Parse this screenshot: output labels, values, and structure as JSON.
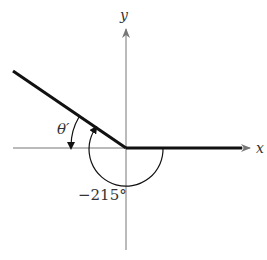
{
  "diagram": {
    "type": "angle-in-standard-position",
    "axes": {
      "x_label": "x",
      "y_label": "y"
    },
    "angle": {
      "label": "−215°",
      "value_degrees": -215,
      "direction": "clockwise"
    },
    "reference_angle": {
      "label": "θ′"
    },
    "colors": {
      "axis": "#777777",
      "terminal": "#111111",
      "text": "#333333"
    }
  }
}
